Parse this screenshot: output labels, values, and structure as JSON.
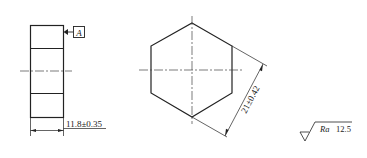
{
  "drawing": {
    "side_view": {
      "datum_label": "A",
      "width_dimension": "11.8±0.35"
    },
    "front_view": {
      "shape": "hexagon",
      "across_flats_dimension": "21±0.42"
    },
    "surface_finish": {
      "parameter": "Ra",
      "value": "12.5"
    }
  },
  "colors": {
    "line": "#222222",
    "background": "#ffffff"
  }
}
